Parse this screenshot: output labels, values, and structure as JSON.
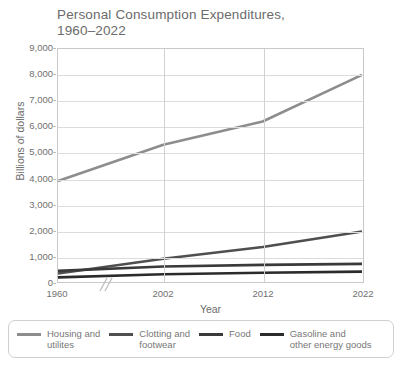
{
  "chart_data": {
    "type": "line",
    "title": "Personal Consumption Expenditures,\n1960–2022",
    "xlabel": "Year",
    "ylabel": "Billions of dollars",
    "x": [
      1960,
      2002,
      2012,
      2022
    ],
    "x_tick_labels": [
      "1960",
      "2002",
      "2012",
      "2022"
    ],
    "y_tick_labels": [
      "0",
      "1,000",
      "2,000",
      "3,000",
      "4,000",
      "5,000",
      "6,000",
      "7,000",
      "8,000",
      "9,000"
    ],
    "ylim": [
      0,
      9000
    ],
    "y_ticks": [
      0,
      1000,
      2000,
      3000,
      4000,
      5000,
      6000,
      7000,
      8000,
      9000
    ],
    "grid": true,
    "axis_break": true,
    "legend_position": "bottom",
    "series": [
      {
        "name": "Housing and\nutilites",
        "color": "#8d8d8d",
        "width": 2.6,
        "values": [
          3900,
          5300,
          6200,
          8000
        ]
      },
      {
        "name": "Clotting and\nfootwear",
        "color": "#4f4f4f",
        "width": 2.6,
        "values": [
          330,
          900,
          1350,
          1950
        ]
      },
      {
        "name": "Food",
        "color": "#3a3a3a",
        "width": 2.6,
        "values": [
          430,
          600,
          660,
          700
        ]
      },
      {
        "name": "Gasoline and\nother energy goods",
        "color": "#2b2b2b",
        "width": 2.6,
        "values": [
          180,
          300,
          360,
          400
        ]
      }
    ]
  },
  "axis": {
    "y_title": "Billions of dollars",
    "x_title": "Year"
  }
}
